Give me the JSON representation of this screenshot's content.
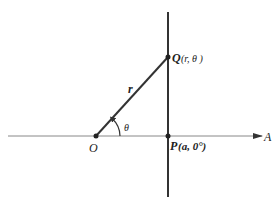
{
  "diagram": {
    "labels": {
      "origin": "O",
      "axis_end": "A",
      "radius": "r",
      "angle": "θ",
      "point_q_name": "Q",
      "point_q_coords": "(r, θ )",
      "point_p_name": "P",
      "point_p_coords": "(a, 0°)"
    },
    "colors": {
      "line": "#333333",
      "axis": "#777777",
      "text": "#222222"
    }
  }
}
